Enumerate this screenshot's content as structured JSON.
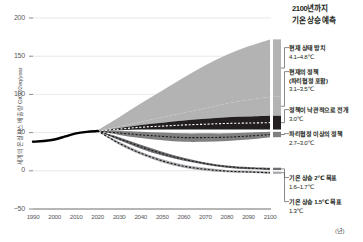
{
  "chart_data": {
    "type": "area",
    "title": "2100년까지 기온 상승 예측",
    "xlabel": "(년)",
    "ylabel": "세계의 온실가스 배출량 GtCO2eq/year",
    "xlim": [
      1990,
      2100
    ],
    "ylim": [
      -50,
      200
    ],
    "grid": true,
    "legend_position": "right",
    "x_ticks": [
      "1990",
      "2000",
      "2010",
      "2020",
      "2030",
      "2040",
      "2050",
      "2060",
      "2070",
      "2080",
      "2090",
      "2100"
    ],
    "y_ticks": [
      "200",
      "150",
      "100",
      "50",
      "0",
      "-50"
    ],
    "historical": {
      "name": "실측 배출량",
      "x": [
        1990,
        1995,
        2000,
        2005,
        2010,
        2015,
        2020
      ],
      "values": [
        38,
        39,
        41,
        45,
        49,
        51,
        52
      ]
    },
    "series": [
      {
        "name": "현재 상태 방치",
        "value_label": "4.1~4.8℃",
        "color": "#b3b3b3",
        "x": [
          2020,
          2030,
          2040,
          2050,
          2060,
          2070,
          2080,
          2090,
          2100
        ],
        "upper": [
          53,
          70,
          88,
          105,
          122,
          138,
          152,
          163,
          172
        ],
        "lower": [
          52,
          58,
          64,
          70,
          76,
          82,
          88,
          93,
          97
        ]
      },
      {
        "name": "현재의 정책 (파리협정 포함)",
        "value_label": "3.1~3.5℃",
        "color": "#b3b3b3",
        "x": [
          2020,
          2030,
          2040,
          2050,
          2060,
          2070,
          2080,
          2090,
          2100
        ],
        "upper": [
          52,
          58,
          64,
          70,
          76,
          82,
          88,
          93,
          97
        ],
        "lower": [
          52,
          56,
          60,
          63,
          66,
          68,
          70,
          71,
          72
        ]
      },
      {
        "name": "정책이 낙관적으로 전개",
        "value_label": "3.0℃",
        "color": "#231f20",
        "x": [
          2020,
          2030,
          2040,
          2050,
          2060,
          2070,
          2080,
          2090,
          2100
        ],
        "upper": [
          52,
          56,
          60,
          63,
          66,
          68,
          70,
          71,
          72
        ],
        "lower": [
          52,
          53,
          54,
          54,
          54,
          54,
          54,
          54,
          54
        ],
        "center": [
          52,
          54.5,
          57,
          58.5,
          60,
          61,
          62,
          62.5,
          63
        ],
        "dashed": true
      },
      {
        "name": "파리협정 이상의 정책",
        "value_label": "2.7~3.0℃",
        "color": "#808080",
        "x": [
          2020,
          2030,
          2040,
          2050,
          2060,
          2070,
          2080,
          2090,
          2100
        ],
        "upper": [
          52,
          52,
          51,
          50,
          49,
          49,
          49,
          50,
          51
        ],
        "lower": [
          52,
          47,
          43,
          40,
          38,
          38,
          39,
          41,
          44
        ],
        "center": [
          52,
          49.5,
          47,
          45,
          43.5,
          43.5,
          44,
          45.5,
          47.5
        ],
        "dashed": true
      },
      {
        "name": "기온 상승 2℃ 목표",
        "value_label": "1.6~1.7℃",
        "color": "#6d6e71",
        "x": [
          2020,
          2030,
          2040,
          2050,
          2060,
          2070,
          2080,
          2090,
          2100
        ],
        "upper": [
          52,
          44,
          34,
          25,
          17,
          11,
          7,
          5,
          4
        ],
        "lower": [
          52,
          40,
          29,
          20,
          13,
          8,
          4,
          2,
          1
        ],
        "center": [
          52,
          42,
          31.5,
          22.5,
          15,
          9.5,
          5.5,
          3.5,
          2.5
        ],
        "dashed": true
      },
      {
        "name": "기온 상승 1.5℃ 목표",
        "value_label": "1.3℃",
        "color": "#a7a9ac",
        "x": [
          2020,
          2030,
          2040,
          2050,
          2060,
          2070,
          2080,
          2090,
          2100
        ],
        "upper": [
          52,
          38,
          25,
          15,
          8,
          4,
          1,
          0,
          -1
        ],
        "lower": [
          52,
          34,
          21,
          11,
          4,
          0,
          -2,
          -3,
          -4
        ],
        "center": [
          52,
          36,
          23,
          13,
          6,
          2,
          -0.5,
          -1.5,
          -2.5
        ],
        "dashed": true
      }
    ],
    "end_markers": [
      {
        "name": "현재 상태 방치",
        "top": 172,
        "bottom": 97,
        "color": "#b3b3b3"
      },
      {
        "name": "현재의 정책",
        "top": 97,
        "bottom": 72,
        "color": "#b3b3b3"
      },
      {
        "name": "정책이 낙관적으로 전개",
        "top": 72,
        "bottom": 54,
        "color": "#231f20"
      },
      {
        "name": "파리협정 이상의 정책",
        "top": 51,
        "bottom": 44,
        "color": "#808080"
      },
      {
        "name": "기온 상승 2℃ 목표",
        "top": 4,
        "bottom": 1,
        "color": "#6d6e71"
      },
      {
        "name": "기온 상승 1.5℃ 목표",
        "top": -1,
        "bottom": -4,
        "color": "#a7a9ac"
      }
    ]
  },
  "legend": {
    "title_line1": "2100년까지",
    "title_line2": "기온 상승 예측",
    "entries": [
      {
        "name_line1": "현재 상태 방치",
        "name_line2": "",
        "value": "4.1~4.8℃",
        "top": 44
      },
      {
        "name_line1": "현재의 정책",
        "name_line2": "(파리협정 포함)",
        "value": "3.1~3.5℃",
        "top": 68
      },
      {
        "name_line1": "정책이 낙관적으로 전개",
        "name_line2": "",
        "value": "3.0℃",
        "top": 106
      },
      {
        "name_line1": "파리협정 이상의 정책",
        "name_line2": "",
        "value": "2.7~3.0℃",
        "top": 130
      },
      {
        "name_line1": "기온 상승 2℃ 목표",
        "name_line2": "",
        "value": "1.6~1.7℃",
        "top": 174
      },
      {
        "name_line1": "기온 상승 1.5℃ 목표",
        "name_line2": "",
        "value": "1.3℃",
        "top": 198
      }
    ]
  }
}
